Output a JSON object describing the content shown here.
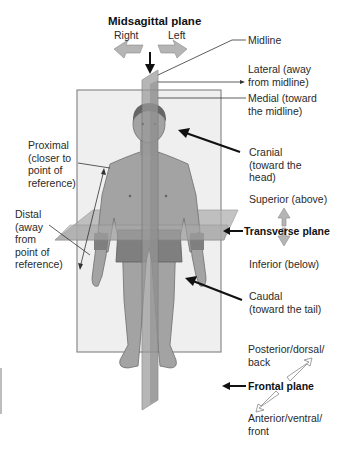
{
  "diagram": {
    "top": {
      "plane_label": "Midsagittal plane",
      "right_label": "Right",
      "left_label": "Left"
    },
    "right_labels": {
      "midline": "Midline",
      "lateral": "Lateral (away\nfrom midline)",
      "medial": "Medial (toward\nthe midline)",
      "cranial": "Cranial\n(toward the\nhead)",
      "superior": "Superior (above)",
      "transverse_plane": "Transverse plane",
      "inferior": "Inferior (below)",
      "caudal": "Caudal\n(toward the tail)",
      "posterior": "Posterior/dorsal/\nback",
      "frontal_plane": "Frontal plane",
      "anterior": "Anterior/ventral/\nfront"
    },
    "left_labels": {
      "proximal": "Proximal\n(closer to\npoint of\nreference)",
      "distal": "Distal\n(away\nfrom\npoint of\nreference)"
    },
    "colors": {
      "frontal_plane_fill": "#efefef",
      "frontal_plane_stroke": "#8a8a8a",
      "sagittal_plane_fill": "#9a9a9a",
      "transverse_plane_fill": "#a8a8a8",
      "skin": "#a3a3a3",
      "skin_dark": "#8c8c8c",
      "hair": "#6a6a6a",
      "shorts": "#7f7f7f",
      "arrow_gray": "#b5b5b5",
      "arrow_black": "#111111"
    }
  }
}
